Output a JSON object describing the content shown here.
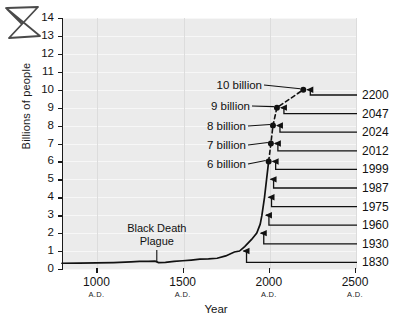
{
  "chart_data": {
    "type": "line",
    "title": "",
    "xlabel": "Year",
    "ylabel": "Billions of people",
    "xlim": [
      800,
      2500
    ],
    "ylim": [
      0,
      14
    ],
    "grid": true,
    "legend_position": "none",
    "y_ticks": [
      "0",
      "1",
      "2",
      "3",
      "4",
      "5",
      "6",
      "7",
      "8",
      "9",
      "10",
      "11",
      "12",
      "13",
      "14"
    ],
    "x_ticks": [
      {
        "value": 1000,
        "label": "1000",
        "era": "A.D."
      },
      {
        "value": 1500,
        "label": "1500",
        "era": "A.D."
      },
      {
        "value": 2000,
        "label": "2000",
        "era": "A.D."
      },
      {
        "value": 2500,
        "label": "2500",
        "era": "A.D."
      }
    ],
    "series": [
      {
        "name": "World population (historical)",
        "style": "solid",
        "x": [
          800,
          900,
          1000,
          1100,
          1200,
          1250,
          1300,
          1340,
          1360,
          1400,
          1450,
          1500,
          1550,
          1600,
          1650,
          1700,
          1750,
          1800,
          1830,
          1860,
          1900,
          1930,
          1950,
          1960,
          1975,
          1987,
          1999
        ],
        "y": [
          0.32,
          0.33,
          0.34,
          0.36,
          0.4,
          0.42,
          0.43,
          0.44,
          0.36,
          0.37,
          0.42,
          0.46,
          0.5,
          0.55,
          0.56,
          0.6,
          0.73,
          0.95,
          1.0,
          1.25,
          1.65,
          2.0,
          2.5,
          3.0,
          4.0,
          5.0,
          6.0
        ]
      },
      {
        "name": "World population (projected)",
        "style": "dashed",
        "x": [
          1999,
          2012,
          2024,
          2047,
          2200
        ],
        "y": [
          6.0,
          7.0,
          8.0,
          9.0,
          10.0
        ]
      }
    ],
    "markers": [
      {
        "year": 1999,
        "value": 6,
        "label": "6 billion"
      },
      {
        "year": 2012,
        "value": 7,
        "label": "7 billion"
      },
      {
        "year": 2024,
        "value": 8,
        "label": "8 billion"
      },
      {
        "year": 2047,
        "value": 9,
        "label": "9 billion"
      },
      {
        "year": 2200,
        "value": 10,
        "label": "10 billion"
      }
    ],
    "right_year_callouts": [
      "2200",
      "2047",
      "2024",
      "2012",
      "1999",
      "1987",
      "1975",
      "1960",
      "1930",
      "1830"
    ],
    "annotations": [
      {
        "name": "black-death",
        "line1": "Black Death",
        "line2": "Plague",
        "points_to_year": 1350
      }
    ]
  },
  "axis": {
    "y_title": "Billions of people",
    "x_title": "Year"
  },
  "marks": {
    "scribble": "hand-drawn-x-mark"
  }
}
